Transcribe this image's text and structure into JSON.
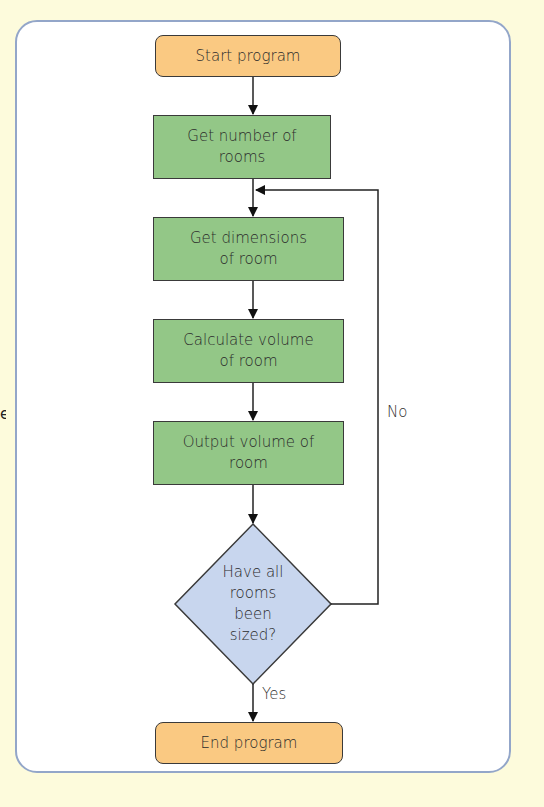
{
  "edge_fragment": "e",
  "flowchart": {
    "start": "Start program",
    "steps": [
      {
        "line1": "Get number of",
        "line2": "rooms"
      },
      {
        "line1": "Get dimensions",
        "line2": "of room"
      },
      {
        "line1": "Calculate volume",
        "line2": "of room"
      },
      {
        "line1": "Output volume of",
        "line2": "room"
      }
    ],
    "decision": {
      "lines": [
        "Have all",
        "rooms",
        "been",
        "sized?"
      ],
      "yes_label": "Yes",
      "no_label": "No"
    },
    "end": "End program"
  },
  "colors": {
    "background": "#fdfbdc",
    "panel_border": "#93a6c9",
    "terminal_fill": "#fac982",
    "process_fill": "#93c787",
    "decision_fill": "#c8d6ee"
  }
}
